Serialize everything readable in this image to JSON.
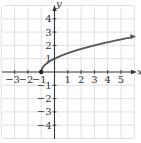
{
  "chart_data": {
    "type": "line",
    "title": "",
    "function": "y = sqrt(x + 1)",
    "xlabel": "x",
    "ylabel": "y",
    "xlim": [
      -4,
      6
    ],
    "ylim": [
      -5,
      5
    ],
    "grid": true,
    "x_ticks": [
      -3,
      -2,
      -1,
      1,
      2,
      3,
      4,
      5
    ],
    "y_ticks": [
      4,
      3,
      2,
      1,
      -1,
      -2,
      -3,
      -4
    ],
    "x_tick_labels": [
      "−3",
      "−2",
      "−1",
      "1",
      "2",
      "3",
      "4",
      "5"
    ],
    "y_tick_labels": [
      "4",
      "3",
      "2",
      "1",
      "−1",
      "−2",
      "−3",
      "−4"
    ],
    "series": [
      {
        "name": "y = √(x+1)",
        "start_point": {
          "x": -1,
          "y": 0,
          "marker": "filled-dot"
        },
        "end": "arrow",
        "x": [
          -1,
          -0.75,
          -0.5,
          0,
          1,
          2,
          3,
          4,
          5,
          5.8
        ],
        "y": [
          0,
          0.5,
          0.71,
          1,
          1.41,
          1.73,
          2,
          2.24,
          2.45,
          2.61
        ]
      }
    ],
    "colors": {
      "curve": "#555555",
      "axes": "#333333",
      "grid": "#d8d8d8"
    }
  }
}
